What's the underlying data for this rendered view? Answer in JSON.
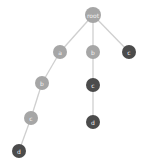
{
  "diagram": {
    "type": "tree",
    "colors": {
      "light": "#a6a6a6",
      "dark": "#4b4b4b",
      "edge": "#cfcfcf",
      "background": "#ffffff"
    },
    "nodes": [
      {
        "id": "root",
        "label": "root",
        "x": 93,
        "y": 15,
        "r": 8,
        "shade": "light"
      },
      {
        "id": "a",
        "label": "a",
        "x": 60,
        "y": 52,
        "r": 7,
        "shade": "light"
      },
      {
        "id": "b1",
        "label": "b",
        "x": 93,
        "y": 52,
        "r": 7,
        "shade": "light"
      },
      {
        "id": "c1",
        "label": "c",
        "x": 129,
        "y": 52,
        "r": 7,
        "shade": "dark"
      },
      {
        "id": "b2",
        "label": "b",
        "x": 42,
        "y": 83,
        "r": 7,
        "shade": "light"
      },
      {
        "id": "c2",
        "label": "c",
        "x": 93,
        "y": 85,
        "r": 7,
        "shade": "dark"
      },
      {
        "id": "c3",
        "label": "c",
        "x": 31,
        "y": 118,
        "r": 7,
        "shade": "light"
      },
      {
        "id": "d1",
        "label": "d",
        "x": 93,
        "y": 122,
        "r": 7,
        "shade": "dark"
      },
      {
        "id": "d2",
        "label": "d",
        "x": 19,
        "y": 151,
        "r": 7,
        "shade": "dark"
      }
    ],
    "edges": [
      {
        "from": "root",
        "to": "a"
      },
      {
        "from": "root",
        "to": "b1"
      },
      {
        "from": "root",
        "to": "c1"
      },
      {
        "from": "a",
        "to": "b2"
      },
      {
        "from": "b1",
        "to": "c2"
      },
      {
        "from": "b2",
        "to": "c3"
      },
      {
        "from": "c2",
        "to": "d1"
      },
      {
        "from": "c3",
        "to": "d2"
      }
    ]
  }
}
